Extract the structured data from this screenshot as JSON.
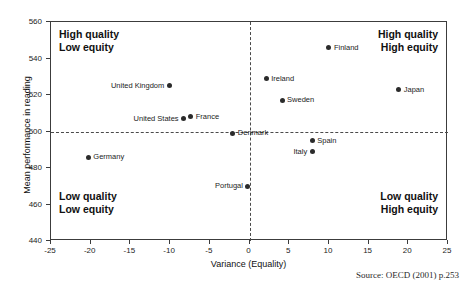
{
  "figure": {
    "title_remnant": "",
    "source_note": "Source: OECD (2001) p.253"
  },
  "quadrants": {
    "top_left": {
      "line1": "High quality",
      "line2": "Low equity"
    },
    "top_right": {
      "line1": "High quality",
      "line2": "High equity"
    },
    "bottom_left": {
      "line1": "Low quality",
      "line2": "Low equity"
    },
    "bottom_right": {
      "line1": "Low quality",
      "line2": "High equity"
    }
  },
  "chart_data": {
    "type": "scatter",
    "title": "",
    "xlabel": "Variance (Equality)",
    "ylabel": "Mean performance in reading",
    "xlim": [
      -25,
      25
    ],
    "ylim": [
      440,
      560
    ],
    "xticks": [
      -25,
      -20,
      -15,
      -10,
      -5,
      0,
      5,
      10,
      15,
      20,
      25
    ],
    "yticks": [
      440,
      460,
      480,
      500,
      520,
      540,
      560
    ],
    "grid": false,
    "legend": "none",
    "reference_lines": [
      {
        "axis": "x",
        "value": 0,
        "style": "dashed"
      },
      {
        "axis": "y",
        "value": 500,
        "style": "dashed"
      }
    ],
    "marker_color": "#2b2b2b",
    "points": [
      {
        "label": "Finland",
        "x": 10.0,
        "y": 546,
        "label_side": "right"
      },
      {
        "label": "Japan",
        "x": 18.8,
        "y": 523,
        "label_side": "right"
      },
      {
        "label": "Ireland",
        "x": 2.1,
        "y": 529,
        "label_side": "right"
      },
      {
        "label": "Sweden",
        "x": 4.1,
        "y": 517,
        "label_side": "right"
      },
      {
        "label": "United Kingdom",
        "x": -10.1,
        "y": 525,
        "label_side": "left"
      },
      {
        "label": "France",
        "x": -7.4,
        "y": 508,
        "label_side": "right"
      },
      {
        "label": "United States",
        "x": -8.3,
        "y": 507,
        "label_side": "left"
      },
      {
        "label": "Denmark",
        "x": -2.1,
        "y": 499,
        "label_side": "right"
      },
      {
        "label": "Spain",
        "x": 7.9,
        "y": 495,
        "label_side": "right"
      },
      {
        "label": "Italy",
        "x": 7.9,
        "y": 489,
        "label_side": "left"
      },
      {
        "label": "Germany",
        "x": -20.3,
        "y": 486,
        "label_side": "right"
      },
      {
        "label": "Portugal",
        "x": -0.2,
        "y": 470,
        "label_side": "left"
      }
    ]
  }
}
